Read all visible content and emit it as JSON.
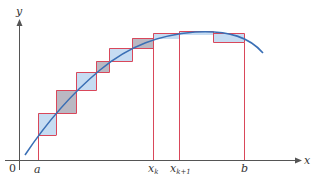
{
  "diagram": {
    "type": "riemann-sum-illustration",
    "colors": {
      "axis": "#555555",
      "curve": "#3a6fb5",
      "rect_border": "#d9475a",
      "fill_blue": "#c6dcf2",
      "fill_gray": "#bab8c2",
      "text": "#333333"
    },
    "axes": {
      "x_label": "x",
      "y_label": "y",
      "origin_label": "0"
    },
    "tick_labels": {
      "a": "a",
      "xk_base": "x",
      "xk_sub": "k",
      "xk1_base": "x",
      "xk1_sub": "k+1",
      "b": "b"
    },
    "rectangles": [
      {
        "x": 38,
        "x2": 56,
        "top": 113,
        "bottom": 135,
        "fill": "blue"
      },
      {
        "x": 56,
        "x2": 76,
        "top": 90,
        "bottom": 113,
        "fill": "gray"
      },
      {
        "x": 76,
        "x2": 96,
        "top": 72,
        "bottom": 90,
        "fill": "blue"
      },
      {
        "x": 96,
        "x2": 109,
        "top": 61,
        "bottom": 72,
        "fill": "gray"
      },
      {
        "x": 109,
        "x2": 132,
        "top": 48,
        "bottom": 61,
        "fill": "blue"
      },
      {
        "x": 132,
        "x2": 153,
        "top": 38,
        "bottom": 48,
        "fill": "gray"
      },
      {
        "x": 153,
        "x2": 179,
        "top": 33,
        "bottom": 38,
        "fill": "blue"
      },
      {
        "x": 179,
        "x2": 213,
        "top": 31,
        "bottom": 34,
        "fill": "blue"
      },
      {
        "x": 213,
        "x2": 244,
        "top": 33,
        "bottom": 42,
        "fill": "blue"
      }
    ]
  }
}
